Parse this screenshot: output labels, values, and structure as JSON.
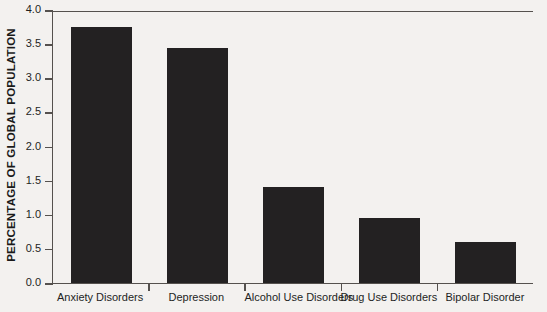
{
  "chart_data": {
    "type": "bar",
    "title": "",
    "xlabel": "",
    "ylabel": "PERCENTAGE OF GLOBAL POPULATION",
    "categories": [
      "Anxiety Disorders",
      "Depression",
      "Alcohol Use Disorders",
      "Drug Use Disorders",
      "Bipolar Disorder"
    ],
    "values": [
      3.75,
      3.45,
      1.4,
      0.95,
      0.6
    ],
    "ylim": [
      0.0,
      4.0
    ],
    "ytick_labels": [
      "0.0",
      "0.5",
      "1.0",
      "1.5",
      "2.0",
      "2.5",
      "3.0",
      "3.5",
      "4.0"
    ],
    "ytick_values": [
      0.0,
      0.5,
      1.0,
      1.5,
      2.0,
      2.5,
      3.0,
      3.5,
      4.0
    ],
    "grid": false,
    "legend": false,
    "legend_position": "none",
    "bar_color": "#232122",
    "background_color": "#f3f1ef",
    "axis_color": "#55514e",
    "text_color": "#231f1e"
  }
}
